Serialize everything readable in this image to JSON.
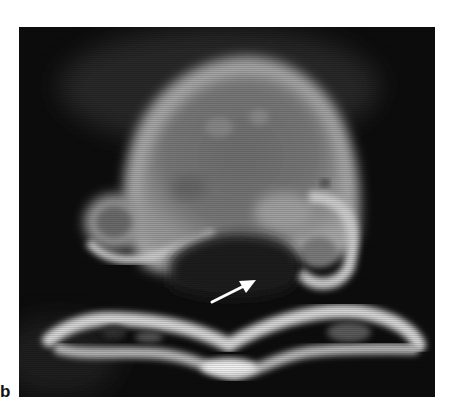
{
  "figure": {
    "panel_label": "b",
    "image_type": "axial CT scan (grayscale)",
    "annotation": {
      "type": "arrow",
      "color": "#ffffff",
      "direction": "pointing up-right"
    }
  }
}
